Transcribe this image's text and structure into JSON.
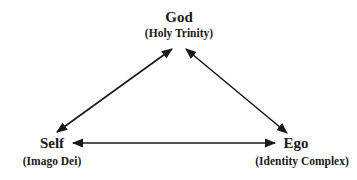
{
  "diagram": {
    "nodes": [
      {
        "id": "god",
        "title": "God",
        "subtitle": "(Holy Trinity)"
      },
      {
        "id": "self",
        "title": "Self",
        "subtitle": "(Imago Dei)"
      },
      {
        "id": "ego",
        "title": "Ego",
        "subtitle": "(Identity Complex)"
      }
    ],
    "edges": [
      {
        "from": "god",
        "to": "self",
        "direction": "bidirectional"
      },
      {
        "from": "god",
        "to": "ego",
        "direction": "bidirectional"
      },
      {
        "from": "self",
        "to": "ego",
        "direction": "bidirectional"
      }
    ],
    "line_color": "#1a1a1a"
  }
}
